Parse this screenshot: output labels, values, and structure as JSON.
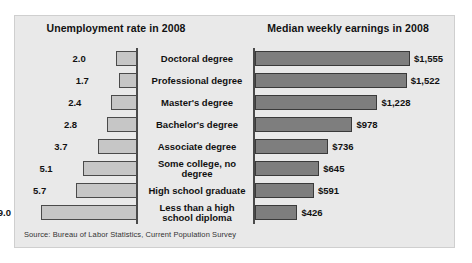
{
  "figure": {
    "left_header": "Unemployment rate in 2008",
    "right_header": "Median weekly earnings in 2008",
    "source": "Source: Bureau of Labor Statistics, Current Population Survey",
    "colors": {
      "panel_background": "#e9e9e9",
      "unemployment_bar": "#c6c6c6",
      "earnings_bar": "#7e7e7e",
      "axis": "#4a4a4a",
      "text": "#111111"
    }
  },
  "chart_data": {
    "type": "bar",
    "layout": "diverging paired horizontal bars sharing centered category labels",
    "categories": [
      "Doctoral degree",
      "Professional degree",
      "Master's degree",
      "Bachelor's degree",
      "Associate degree",
      "Some college, no degree",
      "High school graduate",
      "Less than a high school diploma"
    ],
    "category_display": [
      "Doctoral degree",
      "Professional degree",
      "Master's degree",
      "Bachelor's degree",
      "Associate degree",
      "Some college, no\ndegree",
      "High school graduate",
      "Less than a high\nschool diploma"
    ],
    "series": [
      {
        "name": "Unemployment rate in 2008",
        "unit": "percent",
        "direction": "left",
        "xlabel": "",
        "ylabel": "",
        "xlim": [
          0,
          9.0
        ],
        "values": [
          2.0,
          1.7,
          2.4,
          2.8,
          3.7,
          5.1,
          5.7,
          9.0
        ],
        "labels": [
          "2.0",
          "1.7",
          "2.4",
          "2.8",
          "3.7",
          "5.1",
          "5.7",
          "9.0"
        ]
      },
      {
        "name": "Median weekly earnings in 2008",
        "unit": "US dollars",
        "direction": "right",
        "xlabel": "",
        "ylabel": "",
        "xlim": [
          0,
          1555
        ],
        "values": [
          1555,
          1522,
          1228,
          978,
          736,
          645,
          591,
          426
        ],
        "labels": [
          "$1,555",
          "$1,522",
          "$1,228",
          "$978",
          "$736",
          "$645",
          "$591",
          "$426"
        ]
      }
    ],
    "grid": false,
    "legend": "none"
  }
}
